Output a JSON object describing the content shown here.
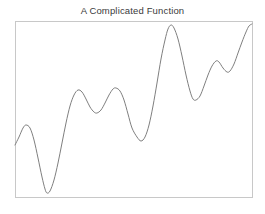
{
  "figure": {
    "width": 265,
    "height": 214,
    "background_color": "#ffffff"
  },
  "chart_data": {
    "type": "line",
    "title": "A Complicated Function",
    "xlabel": "",
    "ylabel": "",
    "xlim": [
      0,
      1
    ],
    "ylim": [
      0,
      1
    ],
    "grid": false,
    "legend": null,
    "axis_ticks_visible": false,
    "tick_labels_x": [],
    "tick_labels_y": [],
    "line_color": "#7f7f7f",
    "line_width": 1,
    "plot_frame": {
      "color": "#c8c8c8",
      "left_px": 15,
      "top_px": 21,
      "right_px": 252,
      "bottom_px": 197
    },
    "series": [
      {
        "name": "complicated function",
        "points_px": [
          [
            15,
            145
          ],
          [
            19,
            137
          ],
          [
            23,
            128
          ],
          [
            26,
            125
          ],
          [
            30,
            128
          ],
          [
            34,
            140
          ],
          [
            38,
            158
          ],
          [
            42,
            177
          ],
          [
            45,
            189
          ],
          [
            47,
            193
          ],
          [
            50,
            191
          ],
          [
            54,
            180
          ],
          [
            58,
            163
          ],
          [
            62,
            143
          ],
          [
            66,
            123
          ],
          [
            70,
            106
          ],
          [
            74,
            95
          ],
          [
            78,
            90
          ],
          [
            82,
            92
          ],
          [
            86,
            99
          ],
          [
            90,
            107
          ],
          [
            94,
            112
          ],
          [
            97,
            113
          ],
          [
            101,
            110
          ],
          [
            105,
            103
          ],
          [
            109,
            95
          ],
          [
            113,
            89
          ],
          [
            116,
            88
          ],
          [
            120,
            91
          ],
          [
            124,
            100
          ],
          [
            128,
            114
          ],
          [
            132,
            128
          ],
          [
            137,
            137
          ],
          [
            141,
            141
          ],
          [
            145,
            137
          ],
          [
            149,
            125
          ],
          [
            153,
            106
          ],
          [
            157,
            83
          ],
          [
            161,
            59
          ],
          [
            165,
            40
          ],
          [
            168,
            29
          ],
          [
            171,
            25
          ],
          [
            174,
            28
          ],
          [
            178,
            39
          ],
          [
            182,
            56
          ],
          [
            186,
            75
          ],
          [
            190,
            91
          ],
          [
            193,
            99
          ],
          [
            196,
            100
          ],
          [
            200,
            96
          ],
          [
            204,
            86
          ],
          [
            208,
            75
          ],
          [
            212,
            66
          ],
          [
            216,
            61
          ],
          [
            219,
            62
          ],
          [
            223,
            68
          ],
          [
            227,
            72
          ],
          [
            230,
            71
          ],
          [
            234,
            64
          ],
          [
            238,
            53
          ],
          [
            242,
            42
          ],
          [
            246,
            32
          ],
          [
            249,
            26
          ],
          [
            252,
            24
          ]
        ],
        "extrema": {
          "peaks_px": [
            [
              26,
              125
            ],
            [
              78,
              90
            ],
            [
              116,
              88
            ],
            [
              171,
              25
            ],
            [
              216,
              61
            ]
          ],
          "troughs_px": [
            [
              47,
              193
            ],
            [
              97,
              113
            ],
            [
              141,
              141
            ],
            [
              196,
              100
            ],
            [
              228,
              72
            ]
          ]
        },
        "start_px": [
          15,
          145
        ],
        "end_px": [
          252,
          24
        ]
      }
    ]
  }
}
